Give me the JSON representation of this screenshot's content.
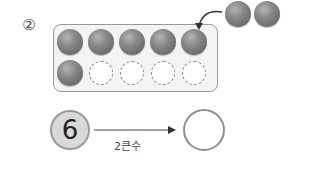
{
  "problem": {
    "number_label": "②",
    "ten_frame": {
      "rows": 2,
      "cols": 5,
      "filled_count": 6,
      "cells": [
        "filled",
        "filled",
        "filled",
        "filled",
        "filled",
        "filled",
        "empty",
        "empty",
        "empty",
        "empty"
      ]
    },
    "extra_balls": {
      "count": 2
    },
    "start_value": "6",
    "operation_label": "2큰수",
    "answer_value": ""
  },
  "colors": {
    "ball": "#7a7a7a",
    "frame_border": "#999999",
    "frame_bg": "#f4f4f4",
    "start_circle_bg": "#d9d9d9",
    "circle_border": "#8f8f8f"
  }
}
